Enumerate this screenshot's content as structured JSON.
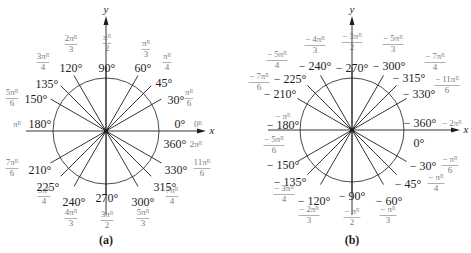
{
  "colors": {
    "line": "#1e1e1e",
    "degree_text": "#1e1e1e",
    "radian_text": "#7a7a7a",
    "background": "#ffffff"
  },
  "panels": [
    {
      "id": "a",
      "caption": "(a)",
      "center": [
        106,
        131
      ],
      "radius": 53,
      "ray_length": 64,
      "x_axis": {
        "from": 26,
        "to": 206,
        "label": "x"
      },
      "y_axis": {
        "from": 215,
        "to": 16,
        "label": "y"
      },
      "angles": [
        {
          "deg": 0,
          "deg_label": "0°",
          "rad_label": "0ᴿ",
          "deg_pos": [
            180,
            125
          ],
          "rad_pos": [
            198,
            125
          ],
          "ray": false
        },
        {
          "deg": 360,
          "deg_label": "360°",
          "rad_label": "2πᴿ",
          "deg_pos": [
            175,
            145
          ],
          "rad_pos": [
            196,
            145
          ],
          "ray": false
        },
        {
          "deg": 30,
          "deg_label": "30°",
          "rad_num": "π",
          "rad_den": "6",
          "deg_pos": [
            176,
            101
          ],
          "rad_pos": [
            189,
            98
          ],
          "ray": true
        },
        {
          "deg": 45,
          "deg_label": "45°",
          "rad_num": "π",
          "rad_den": "4",
          "deg_pos": [
            164,
            84
          ],
          "rad_pos": [
            167,
            62
          ],
          "ray": true
        },
        {
          "deg": 60,
          "deg_label": "60°",
          "rad_num": "π",
          "rad_den": "3",
          "deg_pos": [
            143,
            69
          ],
          "rad_pos": [
            146,
            49
          ],
          "ray": true
        },
        {
          "deg": 90,
          "deg_label": "90°",
          "rad_num": "π",
          "rad_den": "2",
          "deg_pos": [
            107,
            69
          ],
          "rad_pos": [
            107,
            43
          ],
          "ray": true
        },
        {
          "deg": 120,
          "deg_label": "120°",
          "rad_num": "2π",
          "rad_den": "3",
          "deg_pos": [
            71,
            69
          ],
          "rad_pos": [
            71,
            44
          ],
          "ray": true
        },
        {
          "deg": 135,
          "deg_label": "135°",
          "rad_num": "3π",
          "rad_den": "4",
          "deg_pos": [
            47,
            85
          ],
          "rad_pos": [
            43,
            62
          ],
          "ray": true
        },
        {
          "deg": 150,
          "deg_label": "150°",
          "rad_num": "5π",
          "rad_den": "6",
          "deg_pos": [
            36,
            100
          ],
          "rad_pos": [
            12,
            98
          ],
          "ray": true
        },
        {
          "deg": 180,
          "deg_label": "180°",
          "rad_label": "πᴿ",
          "deg_pos": [
            40,
            125
          ],
          "rad_pos": [
            17,
            125
          ],
          "ray": false
        },
        {
          "deg": 210,
          "deg_label": "210°",
          "rad_num": "7π",
          "rad_den": "6",
          "deg_pos": [
            40,
            171
          ],
          "rad_pos": [
            12,
            168
          ],
          "ray": true
        },
        {
          "deg": 225,
          "deg_label": "225°",
          "rad_num": "5π",
          "rad_den": "4",
          "deg_pos": [
            48,
            188
          ],
          "rad_pos": [
            44,
            196
          ],
          "ray": true
        },
        {
          "deg": 240,
          "deg_label": "240°",
          "rad_num": "4π",
          "rad_den": "3",
          "deg_pos": [
            74,
            203
          ],
          "rad_pos": [
            71,
            218
          ],
          "ray": true
        },
        {
          "deg": 270,
          "deg_label": "270°",
          "rad_num": "3π",
          "rad_den": "2",
          "deg_pos": [
            107,
            199
          ],
          "rad_pos": [
            107,
            220
          ],
          "ray": true
        },
        {
          "deg": 300,
          "deg_label": "300°",
          "rad_num": "5π",
          "rad_den": "3",
          "deg_pos": [
            143,
            203
          ],
          "rad_pos": [
            143,
            218
          ],
          "ray": true
        },
        {
          "deg": 315,
          "deg_label": "315°",
          "rad_num": "7π",
          "rad_den": "4",
          "deg_pos": [
            165,
            188
          ],
          "rad_pos": [
            172,
            196
          ],
          "ray": true
        },
        {
          "deg": 330,
          "deg_label": "330°",
          "rad_num": "11π",
          "rad_den": "6",
          "deg_pos": [
            176,
            171
          ],
          "rad_pos": [
            202,
            168
          ],
          "ray": true
        }
      ]
    },
    {
      "id": "b",
      "caption": "(b)",
      "center": [
        352,
        130
      ],
      "radius": 52,
      "ray_length": 63,
      "x_axis": {
        "from": 268,
        "to": 460,
        "label": "x"
      },
      "y_axis": {
        "from": 215,
        "to": 16,
        "label": "y"
      },
      "angles": [
        {
          "deg": -360,
          "deg_label": "− 360°",
          "rad_label": "− 2πᴿ",
          "deg_pos": [
            420,
            124
          ],
          "rad_pos": [
            452,
            124
          ],
          "ray": false
        },
        {
          "deg": 0,
          "deg_label": "0°",
          "deg_pos": [
            419,
            144
          ],
          "ray": false
        },
        {
          "deg": -330,
          "deg_label": "− 330°",
          "rad_num": "− 11π",
          "rad_den": "6",
          "deg_pos": [
            419,
            95
          ],
          "rad_pos": [
            447,
            85
          ],
          "ray": true
        },
        {
          "deg": -315,
          "deg_label": "− 315°",
          "rad_num": "− 7π",
          "rad_den": "4",
          "deg_pos": [
            409,
            79
          ],
          "rad_pos": [
            435,
            62
          ],
          "ray": true
        },
        {
          "deg": -300,
          "deg_label": "− 300°",
          "rad_num": "− 5π",
          "rad_den": "3",
          "deg_pos": [
            389,
            67
          ],
          "rad_pos": [
            393,
            44
          ],
          "ray": true
        },
        {
          "deg": -270,
          "deg_label": "− 270°",
          "rad_num": "− 3π",
          "rad_den": "2",
          "deg_pos": [
            352,
            69
          ],
          "rad_pos": [
            352,
            42
          ],
          "ray": true
        },
        {
          "deg": -240,
          "deg_label": "− 240°",
          "rad_num": "− 4π",
          "rad_den": "3",
          "deg_pos": [
            315,
            67
          ],
          "rad_pos": [
            315,
            45
          ],
          "ray": true
        },
        {
          "deg": -225,
          "deg_label": "− 225°",
          "rad_num": "− 5π",
          "rad_den": "4",
          "deg_pos": [
            290,
            80
          ],
          "rad_pos": [
            277,
            60
          ],
          "ray": true
        },
        {
          "deg": -210,
          "deg_label": "− 210°",
          "rad_num": "− 7π",
          "rad_den": "6",
          "deg_pos": [
            280,
            95
          ],
          "rad_pos": [
            259,
            82
          ],
          "ray": true
        },
        {
          "deg": -180,
          "deg_label": "− 180°",
          "rad_label": "− πᴿ",
          "deg_pos": [
            283,
            126
          ],
          "rad_pos": [
            283,
            117
          ],
          "ray": false
        },
        {
          "deg": -150,
          "deg_label": "− 150°",
          "rad_num": "− 5π",
          "rad_den": "6",
          "deg_pos": [
            283,
            166
          ],
          "rad_pos": [
            274,
            145
          ],
          "ray": true
        },
        {
          "deg": -135,
          "deg_label": "− 135°",
          "rad_num": "− 3π",
          "rad_den": "4",
          "deg_pos": [
            290,
            183
          ],
          "rad_pos": [
            284,
            194
          ],
          "ray": true
        },
        {
          "deg": -120,
          "deg_label": "− 120°",
          "rad_num": "− 2π",
          "rad_den": "3",
          "deg_pos": [
            314,
            202
          ],
          "rad_pos": [
            309,
            215
          ],
          "ray": true
        },
        {
          "deg": -90,
          "deg_label": "− 90°",
          "rad_num": "− π",
          "rad_den": "2",
          "deg_pos": [
            352,
            197
          ],
          "rad_pos": [
            352,
            217
          ],
          "ray": true
        },
        {
          "deg": -60,
          "deg_label": "− 60°",
          "rad_num": "− π",
          "rad_den": "3",
          "deg_pos": [
            389,
            202
          ],
          "rad_pos": [
            388,
            215
          ],
          "ray": true
        },
        {
          "deg": -45,
          "deg_label": "− 45°",
          "rad_num": "− π",
          "rad_den": "4",
          "deg_pos": [
            408,
            185
          ],
          "rad_pos": [
            436,
            183
          ],
          "ray": true
        },
        {
          "deg": -30,
          "deg_label": "− 30°",
          "rad_num": "− π",
          "rad_den": "6",
          "deg_pos": [
            423,
            167
          ],
          "rad_pos": [
            450,
            165
          ],
          "ray": true
        }
      ]
    }
  ]
}
